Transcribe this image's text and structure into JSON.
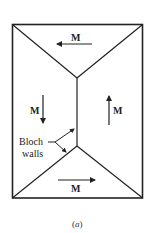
{
  "figure": {
    "caption_open": "(",
    "caption_letter": "a",
    "caption_close": ")"
  },
  "domains": {
    "top": {
      "label": "M",
      "direction": "left"
    },
    "left": {
      "label": "M",
      "direction": "down"
    },
    "right": {
      "label": "M",
      "direction": "up"
    },
    "bottom": {
      "label": "M",
      "direction": "right"
    }
  },
  "annotation": {
    "line1": "Bloch",
    "line2": "walls"
  },
  "colors": {
    "stroke": "#222222",
    "background": "#ffffff"
  }
}
